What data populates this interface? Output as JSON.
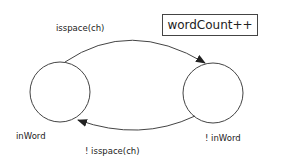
{
  "diagram": {
    "type": "state-machine",
    "action_box": {
      "label": "wordCount++"
    },
    "states": [
      {
        "id": "inWord",
        "label": "inWord"
      },
      {
        "id": "notInWord",
        "label": "! inWord"
      }
    ],
    "transitions": [
      {
        "from": "inWord",
        "to": "notInWord",
        "label": "isspace(ch)"
      },
      {
        "from": "notInWord",
        "to": "inWord",
        "label": "! isspace(ch)"
      }
    ],
    "colors": {
      "stroke": "#333333",
      "background": "#ffffff"
    }
  }
}
